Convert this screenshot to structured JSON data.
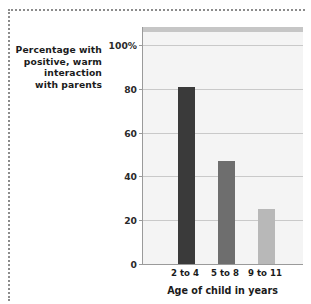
{
  "chart_data": {
    "type": "bar",
    "title": "",
    "categories": [
      "2 to 4",
      "5 to 8",
      "9 to 11"
    ],
    "values": [
      81,
      47,
      25
    ],
    "series": [
      {
        "name": "Percentage with positive, warm interaction with parents",
        "values": [
          81,
          47,
          25
        ]
      }
    ],
    "ylabel": "Percentage with positive, warm interaction with parents",
    "xlabel": "Age of child in years",
    "ylim": [
      0,
      100
    ],
    "yticks": [
      0,
      20,
      40,
      60,
      80,
      100
    ],
    "ytick_labels": [
      "0",
      "20",
      "40",
      "60",
      "80",
      "100%"
    ],
    "grid": true,
    "legend": false,
    "bar_colors": [
      "#3a3a3a",
      "#6e6e6e",
      "#b8b8b8"
    ],
    "plot_background": "#f4f4f4",
    "gridline_color": "#c9c9c9",
    "axis_color": "#9a9a9a"
  },
  "axis": {
    "y_caption_lines": [
      "Percentage with",
      "positive, warm",
      "interaction",
      "with parents"
    ],
    "x_title": "Age of child in years"
  },
  "frame": {
    "border_color": "#8c8c8c",
    "border_style": "dotted"
  }
}
